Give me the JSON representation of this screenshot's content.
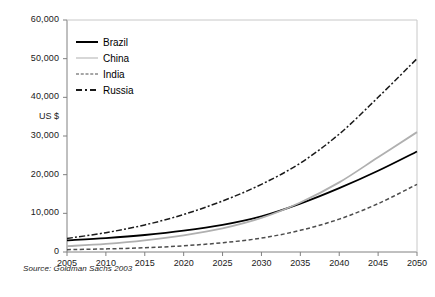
{
  "chart_data": {
    "type": "line",
    "title": "",
    "xlabel": "",
    "ylabel": "US $",
    "xlim": [
      2005,
      2050
    ],
    "ylim": [
      0,
      60000
    ],
    "grid": false,
    "legend_position": "top-left inside plot",
    "x": [
      2005,
      2010,
      2015,
      2020,
      2025,
      2030,
      2035,
      2040,
      2045,
      2050
    ],
    "xtick_labels": [
      "2005",
      "2010",
      "2015",
      "2020",
      "2025",
      "2030",
      "2035",
      "2040",
      "2045",
      "2050"
    ],
    "ytick_labels": [
      "0",
      "10,000",
      "20,000",
      "30,000",
      "40,000",
      "50,000",
      "60,000"
    ],
    "ytick_values": [
      0,
      10000,
      20000,
      30000,
      40000,
      50000,
      60000
    ],
    "series": [
      {
        "name": "Brazil",
        "style": "solid",
        "color": "#000000",
        "values": [
          3000,
          3600,
          4400,
          5500,
          7000,
          9200,
          12500,
          16500,
          21000,
          26000
        ]
      },
      {
        "name": "China",
        "style": "solid",
        "color": "#b0b0b0",
        "values": [
          1500,
          2100,
          3000,
          4300,
          6100,
          8800,
          12800,
          18000,
          24500,
          31000
        ]
      },
      {
        "name": "India",
        "style": "dashed",
        "color": "#4d4d4d",
        "values": [
          600,
          800,
          1100,
          1600,
          2400,
          3600,
          5600,
          8500,
          12500,
          17500
        ]
      },
      {
        "name": "Russia",
        "style": "dash-dot",
        "color": "#1a1a1a",
        "values": [
          3500,
          5000,
          7000,
          9700,
          13200,
          17500,
          23000,
          30500,
          40000,
          50000
        ]
      }
    ],
    "source": "Source:  Goldman Sachs 2003"
  },
  "legend": {
    "items": [
      {
        "label": "Brazil"
      },
      {
        "label": "China"
      },
      {
        "label": "India"
      },
      {
        "label": "Russia"
      }
    ]
  },
  "axes": {
    "y_axis_title": "US $"
  }
}
